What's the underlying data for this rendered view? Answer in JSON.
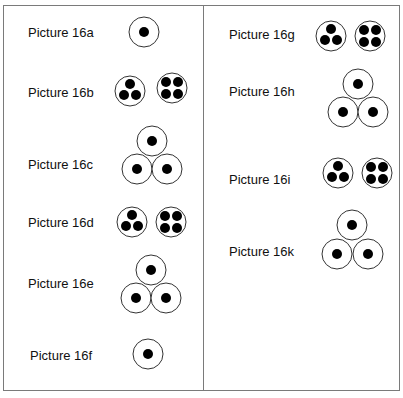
{
  "pictures": [
    {
      "id": "16a",
      "label": "Picture 16a",
      "type": "single-insulated"
    },
    {
      "id": "16b",
      "label": "Picture 16b",
      "type": "three-and-four-core"
    },
    {
      "id": "16c",
      "label": "Picture 16c",
      "type": "trefoil"
    },
    {
      "id": "16d",
      "label": "Picture 16d",
      "type": "three-and-four-core"
    },
    {
      "id": "16e",
      "label": "Picture 16e",
      "type": "trefoil"
    },
    {
      "id": "16f",
      "label": "Picture 16f",
      "type": "single-insulated"
    },
    {
      "id": "16g",
      "label": "Picture 16g",
      "type": "three-and-four-core"
    },
    {
      "id": "16h",
      "label": "Picture 16h",
      "type": "trefoil"
    },
    {
      "id": "16i",
      "label": "Picture 16i",
      "type": "three-and-four-core"
    },
    {
      "id": "16k",
      "label": "Picture 16k",
      "type": "trefoil"
    }
  ],
  "colors": {
    "stroke": "#333333",
    "core": "#000000",
    "border": "#7a7a7a"
  }
}
